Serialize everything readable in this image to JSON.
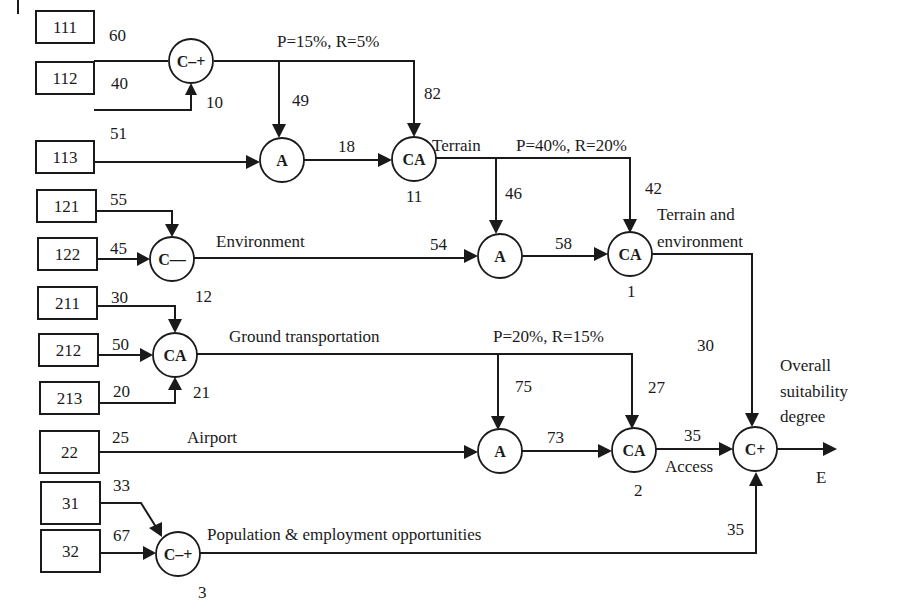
{
  "colors": {
    "ink": "#1a1a1a",
    "background": "#ffffff"
  },
  "inputs": [
    {
      "id": "111",
      "x": 36,
      "y": 11,
      "w": 58,
      "h": 32
    },
    {
      "id": "112",
      "x": 36,
      "y": 62,
      "w": 58,
      "h": 32
    },
    {
      "id": "113",
      "x": 36,
      "y": 141,
      "w": 58,
      "h": 32
    },
    {
      "id": "121",
      "x": 37,
      "y": 190,
      "w": 59,
      "h": 32
    },
    {
      "id": "122",
      "x": 38,
      "y": 238,
      "w": 59,
      "h": 32
    },
    {
      "id": "211",
      "x": 38,
      "y": 287,
      "w": 59,
      "h": 32
    },
    {
      "id": "212",
      "x": 39,
      "y": 334,
      "w": 59,
      "h": 32
    },
    {
      "id": "213",
      "x": 40,
      "y": 382,
      "w": 59,
      "h": 32
    },
    {
      "id": "22",
      "x": 40,
      "y": 431,
      "w": 59,
      "h": 42
    },
    {
      "id": "31",
      "x": 41,
      "y": 482,
      "w": 59,
      "h": 42
    },
    {
      "id": "32",
      "x": 41,
      "y": 530,
      "w": 59,
      "h": 42
    }
  ],
  "nodes": [
    {
      "key": "n10",
      "op": "C–+",
      "cx": 191,
      "cy": 61,
      "label": "10",
      "lx": 206,
      "ly": 108
    },
    {
      "key": "nA1",
      "op": "A",
      "cx": 282,
      "cy": 160,
      "label": "",
      "lx": 0,
      "ly": 0
    },
    {
      "key": "n11",
      "op": "CA",
      "cx": 414,
      "cy": 159,
      "label": "11",
      "lx": 406,
      "ly": 202
    },
    {
      "key": "n12",
      "op": "C––",
      "cx": 172,
      "cy": 259,
      "label": "12",
      "lx": 195,
      "ly": 302
    },
    {
      "key": "nA2",
      "op": "A",
      "cx": 500,
      "cy": 256,
      "label": "",
      "lx": 0,
      "ly": 0
    },
    {
      "key": "n1",
      "op": "CA",
      "cx": 630,
      "cy": 254,
      "label": "1",
      "lx": 627,
      "ly": 297
    },
    {
      "key": "n21",
      "op": "CA",
      "cx": 175,
      "cy": 355,
      "label": "21",
      "lx": 193,
      "ly": 398
    },
    {
      "key": "nA3",
      "op": "A",
      "cx": 500,
      "cy": 451,
      "label": "",
      "lx": 0,
      "ly": 0
    },
    {
      "key": "n2",
      "op": "CA",
      "cx": 634,
      "cy": 450,
      "label": "2",
      "lx": 634,
      "ly": 496
    },
    {
      "key": "nE",
      "op": "C+",
      "cx": 755,
      "cy": 449,
      "label": "",
      "lx": 0,
      "ly": 0
    },
    {
      "key": "n3",
      "op": "C–+",
      "cx": 178,
      "cy": 554,
      "label": "3",
      "lx": 198,
      "ly": 598
    }
  ],
  "weights": [
    {
      "v": "60",
      "x": 109,
      "y": 41
    },
    {
      "v": "40",
      "x": 111,
      "y": 89
    },
    {
      "v": "51",
      "x": 110,
      "y": 139
    },
    {
      "v": "49",
      "x": 292,
      "y": 106
    },
    {
      "v": "82",
      "x": 424,
      "y": 99
    },
    {
      "v": "18",
      "x": 338,
      "y": 152
    },
    {
      "v": "46",
      "x": 505,
      "y": 199
    },
    {
      "v": "42",
      "x": 645,
      "y": 194
    },
    {
      "v": "55",
      "x": 110,
      "y": 205
    },
    {
      "v": "45",
      "x": 110,
      "y": 254
    },
    {
      "v": "54",
      "x": 430,
      "y": 250
    },
    {
      "v": "58",
      "x": 555,
      "y": 249
    },
    {
      "v": "30",
      "x": 111,
      "y": 303
    },
    {
      "v": "50",
      "x": 112,
      "y": 350
    },
    {
      "v": "20",
      "x": 113,
      "y": 397
    },
    {
      "v": "75",
      "x": 515,
      "y": 392
    },
    {
      "v": "27",
      "x": 648,
      "y": 393
    },
    {
      "v": "25",
      "x": 112,
      "y": 443
    },
    {
      "v": "73",
      "x": 547,
      "y": 443
    },
    {
      "v": "35",
      "x": 684,
      "y": 441
    },
    {
      "v": "30",
      "x": 697,
      "y": 351
    },
    {
      "v": "33",
      "x": 113,
      "y": 491
    },
    {
      "v": "67",
      "x": 113,
      "y": 541
    },
    {
      "v": "35",
      "x": 727,
      "y": 535
    }
  ],
  "annotations": [
    {
      "key": "pr1",
      "text": "P=15%, R=5%",
      "x": 277,
      "y": 47
    },
    {
      "key": "terrain",
      "text": "Terrain",
      "x": 432,
      "y": 151
    },
    {
      "key": "pr2",
      "text": "P=40%, R=20%",
      "x": 516,
      "y": 151
    },
    {
      "key": "te1",
      "text": "Terrain and",
      "x": 657,
      "y": 220
    },
    {
      "key": "te2",
      "text": "environment",
      "x": 657,
      "y": 247
    },
    {
      "key": "environment",
      "text": "Environment",
      "x": 216,
      "y": 247
    },
    {
      "key": "ground",
      "text": "Ground transportation",
      "x": 229,
      "y": 342
    },
    {
      "key": "pr3",
      "text": "P=20%, R=15%",
      "x": 493,
      "y": 342
    },
    {
      "key": "airport",
      "text": "Airport",
      "x": 187,
      "y": 443
    },
    {
      "key": "access",
      "text": "Access",
      "x": 665,
      "y": 472
    },
    {
      "key": "pop",
      "text": "Population & employment opportunities",
      "x": 207,
      "y": 540
    },
    {
      "key": "os1",
      "text": "Overall",
      "x": 780,
      "y": 371
    },
    {
      "key": "os2",
      "text": "suitability",
      "x": 780,
      "y": 397
    },
    {
      "key": "os3",
      "text": "degree",
      "x": 780,
      "y": 422
    },
    {
      "key": "E",
      "text": "E",
      "x": 816,
      "y": 483
    }
  ]
}
